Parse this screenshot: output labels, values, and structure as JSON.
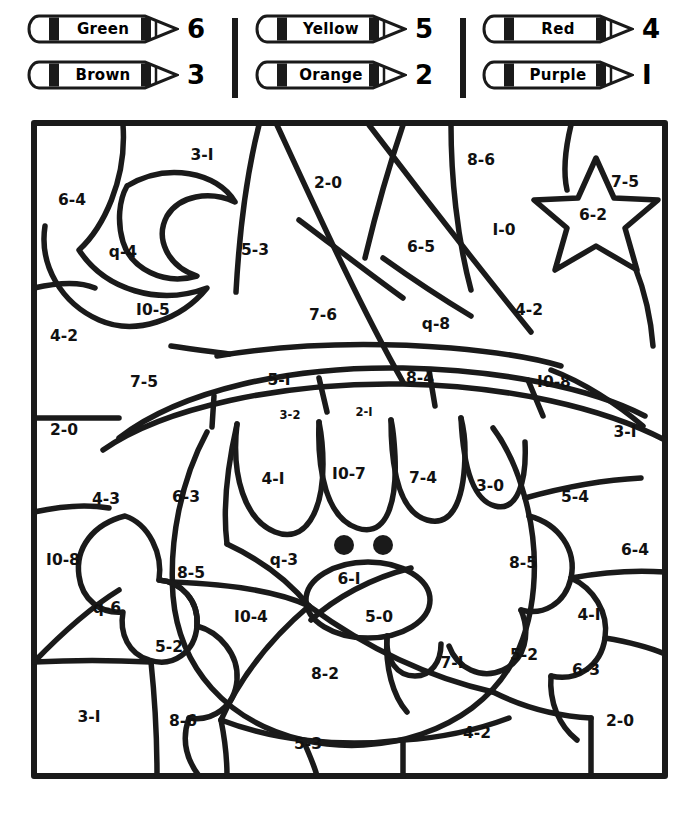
{
  "page": {
    "type": "color-by-number-worksheet",
    "ink_color": "#1a1a1a",
    "paper_color": "#ffffff"
  },
  "legend": {
    "name": "crayon-color-key",
    "separators": 2,
    "columns": [
      {
        "items": [
          {
            "color_name": "Green",
            "number": "6",
            "icon": "crayon-icon"
          },
          {
            "color_name": "Brown",
            "number": "3",
            "icon": "crayon-icon"
          }
        ]
      },
      {
        "items": [
          {
            "color_name": "Yellow",
            "number": "5",
            "icon": "crayon-icon"
          },
          {
            "color_name": "Orange",
            "number": "2",
            "icon": "crayon-icon"
          }
        ]
      },
      {
        "items": [
          {
            "color_name": "Red",
            "number": "4",
            "icon": "crayon-icon"
          },
          {
            "color_name": "Purple",
            "number": "I",
            "icon": "crayon-icon"
          }
        ]
      }
    ]
  },
  "puzzle": {
    "name": "color-by-number-grid",
    "frame": {
      "x": 31,
      "y": 120,
      "width": 637,
      "height": 659
    },
    "regions": [
      {
        "label": "3-I",
        "x": 171,
        "y": 35,
        "size": "normal"
      },
      {
        "label": "6-4",
        "x": 41,
        "y": 80,
        "size": "normal"
      },
      {
        "label": "2-0",
        "x": 297,
        "y": 63,
        "size": "normal"
      },
      {
        "label": "8-6",
        "x": 450,
        "y": 40,
        "size": "normal"
      },
      {
        "label": "7-5",
        "x": 594,
        "y": 62,
        "size": "normal"
      },
      {
        "label": "q-4",
        "x": 92,
        "y": 132,
        "size": "normal"
      },
      {
        "label": "5-3",
        "x": 224,
        "y": 130,
        "size": "normal"
      },
      {
        "label": "6-5",
        "x": 390,
        "y": 127,
        "size": "normal"
      },
      {
        "label": "I-0",
        "x": 473,
        "y": 110,
        "size": "normal"
      },
      {
        "label": "6-2",
        "x": 562,
        "y": 95,
        "size": "normal"
      },
      {
        "label": "I0-5",
        "x": 122,
        "y": 190,
        "size": "normal"
      },
      {
        "label": "7-6",
        "x": 292,
        "y": 195,
        "size": "normal"
      },
      {
        "label": "q-8",
        "x": 405,
        "y": 204,
        "size": "normal"
      },
      {
        "label": "4-2",
        "x": 498,
        "y": 190,
        "size": "normal"
      },
      {
        "label": "4-2",
        "x": 33,
        "y": 216,
        "size": "normal"
      },
      {
        "label": "7-5",
        "x": 113,
        "y": 262,
        "size": "normal"
      },
      {
        "label": "5-I",
        "x": 248,
        "y": 260,
        "size": "normal"
      },
      {
        "label": "8-4",
        "x": 389,
        "y": 258,
        "size": "normal"
      },
      {
        "label": "I0-8",
        "x": 523,
        "y": 262,
        "size": "normal"
      },
      {
        "label": "2-0",
        "x": 33,
        "y": 310,
        "size": "normal"
      },
      {
        "label": "3-2",
        "x": 259,
        "y": 295,
        "size": "small"
      },
      {
        "label": "2-I",
        "x": 333,
        "y": 292,
        "size": "small"
      },
      {
        "label": "3-I",
        "x": 594,
        "y": 312,
        "size": "normal"
      },
      {
        "label": "4-I",
        "x": 242,
        "y": 359,
        "size": "normal"
      },
      {
        "label": "I0-7",
        "x": 318,
        "y": 354,
        "size": "normal"
      },
      {
        "label": "7-4",
        "x": 392,
        "y": 358,
        "size": "normal"
      },
      {
        "label": "3-0",
        "x": 459,
        "y": 366,
        "size": "normal"
      },
      {
        "label": "4-3",
        "x": 75,
        "y": 379,
        "size": "normal"
      },
      {
        "label": "6-3",
        "x": 155,
        "y": 377,
        "size": "normal"
      },
      {
        "label": "5-4",
        "x": 544,
        "y": 377,
        "size": "normal"
      },
      {
        "label": "I0-8",
        "x": 32,
        "y": 440,
        "size": "normal"
      },
      {
        "label": "8-5",
        "x": 160,
        "y": 453,
        "size": "normal"
      },
      {
        "label": "q-3",
        "x": 253,
        "y": 440,
        "size": "normal"
      },
      {
        "label": "6-I",
        "x": 318,
        "y": 459,
        "size": "normal"
      },
      {
        "label": "8-5",
        "x": 492,
        "y": 443,
        "size": "normal"
      },
      {
        "label": "6-4",
        "x": 604,
        "y": 430,
        "size": "normal"
      },
      {
        "label": "q-6",
        "x": 76,
        "y": 488,
        "size": "normal"
      },
      {
        "label": "I0-4",
        "x": 220,
        "y": 497,
        "size": "normal"
      },
      {
        "label": "5-0",
        "x": 348,
        "y": 497,
        "size": "normal"
      },
      {
        "label": "4-I",
        "x": 558,
        "y": 495,
        "size": "normal"
      },
      {
        "label": "5-2",
        "x": 138,
        "y": 527,
        "size": "normal"
      },
      {
        "label": "8-2",
        "x": 294,
        "y": 554,
        "size": "normal"
      },
      {
        "label": "7-I",
        "x": 421,
        "y": 543,
        "size": "normal"
      },
      {
        "label": "5-2",
        "x": 493,
        "y": 535,
        "size": "normal"
      },
      {
        "label": "6-3",
        "x": 555,
        "y": 550,
        "size": "normal"
      },
      {
        "label": "3-I",
        "x": 58,
        "y": 597,
        "size": "normal"
      },
      {
        "label": "8-6",
        "x": 152,
        "y": 601,
        "size": "normal"
      },
      {
        "label": "5-3",
        "x": 277,
        "y": 624,
        "size": "normal"
      },
      {
        "label": "4-2",
        "x": 446,
        "y": 613,
        "size": "normal"
      },
      {
        "label": "2-0",
        "x": 589,
        "y": 601,
        "size": "normal"
      }
    ]
  }
}
